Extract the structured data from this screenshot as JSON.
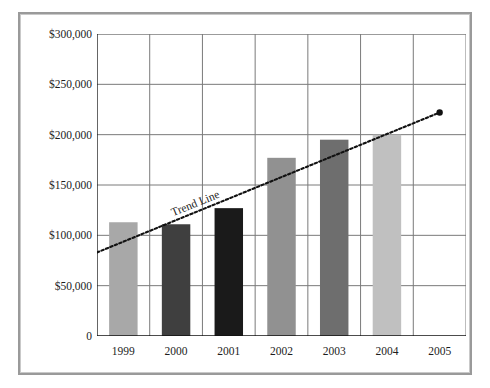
{
  "chart_data": {
    "type": "bar",
    "title": "",
    "subtitle": "",
    "xlabel": "",
    "ylabel": "",
    "categories": [
      "1999",
      "2000",
      "2001",
      "2002",
      "2003",
      "2004",
      "2005"
    ],
    "values": [
      113000,
      111000,
      127000,
      177000,
      195000,
      200000,
      null
    ],
    "bar_colors": [
      "#a8a8a8",
      "#3f3f3f",
      "#1a1a1a",
      "#919191",
      "#6e6e6e",
      "#c0c0c0",
      null
    ],
    "ylim": [
      0,
      300000
    ],
    "ytick_values": [
      0,
      50000,
      100000,
      150000,
      200000,
      250000,
      300000
    ],
    "ytick_labels": [
      "0",
      "$50,000",
      "$100,000",
      "$150,000",
      "$200,000",
      "$250,000",
      "$300,000"
    ],
    "grid": true,
    "grid_color": "#7a7a7a",
    "legend": false,
    "legend_position": "none",
    "annotations": [
      {
        "name": "trend-line",
        "label": "Trend Line",
        "style": "dotted",
        "color": "#111111",
        "start": {
          "x_category": "1999",
          "value": 83000
        },
        "end": {
          "x_category": "2005",
          "value": 222000
        },
        "end_marker": "dot"
      }
    ]
  },
  "axis": {
    "y_max_label": "$300,000",
    "zero_label": "0"
  },
  "frame": {
    "border_color": "#9a9a9a",
    "background": "#ffffff"
  }
}
